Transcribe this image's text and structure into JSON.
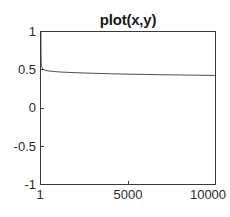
{
  "chart_data": {
    "type": "line",
    "title": "plot(x,y)",
    "xlabel": "",
    "ylabel": "",
    "xlim": [
      1,
      10000
    ],
    "ylim": [
      -1,
      1
    ],
    "grid": false,
    "legend": null,
    "xticks": [
      {
        "value": 1,
        "label": "1"
      },
      {
        "value": 5000,
        "label": "5000"
      },
      {
        "value": 10000,
        "label": "10000"
      }
    ],
    "yticks": [
      {
        "value": 1,
        "label": "1"
      },
      {
        "value": 0.5,
        "label": "0.5"
      },
      {
        "value": 0,
        "label": "0"
      },
      {
        "value": -0.5,
        "label": "-0.5"
      },
      {
        "value": -1,
        "label": "-1"
      }
    ],
    "series": [
      {
        "name": "y",
        "color": "#4d4d4d",
        "width": 1,
        "x": [
          1,
          2,
          3,
          5,
          8,
          12,
          18,
          26,
          38,
          55,
          80,
          115,
          165,
          240,
          350,
          500,
          720,
          1000,
          1400,
          1900,
          2500,
          3200,
          4000,
          5000,
          6000,
          7000,
          8000,
          9000,
          10000
        ],
        "y": [
          1.0,
          0.86,
          0.78,
          0.705,
          0.648,
          0.612,
          0.585,
          0.564,
          0.548,
          0.534,
          0.522,
          0.512,
          0.504,
          0.497,
          0.4905,
          0.4855,
          0.4805,
          0.4755,
          0.4705,
          0.4655,
          0.4605,
          0.4555,
          0.4505,
          0.4455,
          0.4415,
          0.4375,
          0.4345,
          0.4315,
          0.4285
        ]
      }
    ]
  },
  "axes": {
    "frame_color": "#3a3a3a",
    "background": "#ffffff"
  }
}
